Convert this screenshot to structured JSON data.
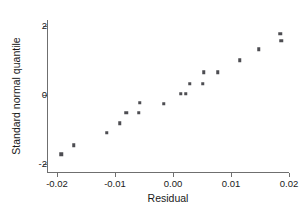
{
  "chart_data": {
    "type": "scatter",
    "title": "",
    "xlabel": "Residual",
    "ylabel": "Standard normal quantile",
    "xlim": [
      -0.0235,
      0.0205
    ],
    "ylim": [
      -2.45,
      2.3
    ],
    "xticks": [
      -0.02,
      -0.01,
      0.0,
      0.01,
      0.02
    ],
    "xticklabels": [
      "-0.02",
      "-0.01",
      "0.00",
      "0.01",
      "0.02"
    ],
    "yticks": [
      2,
      0,
      -2
    ],
    "yticklabels": [
      "2",
      "0",
      "-2"
    ],
    "grid": false,
    "legend": null,
    "marker": "square",
    "marker_color": "#4d4d52",
    "points": [
      {
        "x": -0.0193,
        "y": -1.72
      },
      {
        "x": -0.0171,
        "y": -1.46
      },
      {
        "x": -0.0114,
        "y": -1.09
      },
      {
        "x": -0.0092,
        "y": -0.82
      },
      {
        "x": -0.0081,
        "y": -0.52
      },
      {
        "x": -0.0059,
        "y": -0.52
      },
      {
        "x": -0.0057,
        "y": -0.23
      },
      {
        "x": -0.0016,
        "y": -0.26
      },
      {
        "x": 0.0013,
        "y": 0.04
      },
      {
        "x": 0.0022,
        "y": 0.04
      },
      {
        "x": 0.0029,
        "y": 0.33
      },
      {
        "x": 0.0051,
        "y": 0.33
      },
      {
        "x": 0.0053,
        "y": 0.66
      },
      {
        "x": 0.0077,
        "y": 0.66
      },
      {
        "x": 0.0115,
        "y": 1.01
      },
      {
        "x": 0.0148,
        "y": 1.33
      },
      {
        "x": 0.0185,
        "y": 1.78
      },
      {
        "x": 0.0187,
        "y": 1.57
      }
    ]
  },
  "axes": {
    "x_title": "Residual",
    "y_title": "Standard normal quantile"
  },
  "colors": {
    "marker": "#4d4d52",
    "axis": "#6f6f6f",
    "text": "#1a1a1a",
    "background": "#ffffff"
  }
}
